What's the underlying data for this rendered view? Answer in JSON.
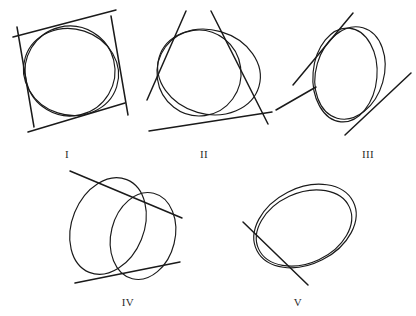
{
  "plate": {
    "title": "",
    "background_color": "#ffffff",
    "ink_color": "#1a1a1a",
    "width": 416,
    "height": 316,
    "figure_count": 5
  },
  "figures": [
    {
      "id": "figure-1",
      "label": "I",
      "label_x": 67,
      "label_y": 155,
      "description": "circle inscribed in a tilted quadrilateral formed by four tangent lines",
      "conic_count": 2,
      "tangent_count": 4,
      "center_x": 68,
      "center_y": 70
    },
    {
      "id": "figure-2",
      "label": "II",
      "label_x": 203,
      "label_y": 155,
      "description": "two overlapping ovals touching three tangent lines forming a triangle",
      "conic_count": 2,
      "tangent_count": 3,
      "center_x": 208,
      "center_y": 70
    },
    {
      "id": "figure-3",
      "label": "III",
      "label_x": 368,
      "label_y": 155,
      "description": "two overlapping tilted ellipses with two crossing tangent lines",
      "conic_count": 2,
      "tangent_count": 2,
      "center_x": 348,
      "center_y": 70
    },
    {
      "id": "figure-4",
      "label": "IV",
      "label_x": 128,
      "label_y": 303,
      "description": "two large offset ellipses resembling a cylinder with two tangent lines",
      "conic_count": 2,
      "tangent_count": 2,
      "center_x": 120,
      "center_y": 228
    },
    {
      "id": "figure-5",
      "label": "V",
      "label_x": 298,
      "label_y": 303,
      "description": "two nearly concentric tilted ellipses with one tangent line",
      "conic_count": 2,
      "tangent_count": 1,
      "center_x": 305,
      "center_y": 228
    }
  ],
  "labels": {
    "fig1": "I",
    "fig2": "II",
    "fig3": "III",
    "fig4": "IV",
    "fig5": "V"
  }
}
